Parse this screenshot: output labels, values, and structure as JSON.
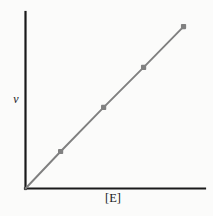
{
  "figure": {
    "background_color": "#fbfbfa",
    "axis_color": "#1a1a1a",
    "series_color": "#808080"
  },
  "labels": {
    "y_axis": "v",
    "x_axis": "[E]"
  },
  "chart_data": {
    "type": "line",
    "title": "",
    "subtitle": "",
    "xlabel": "[E]",
    "ylabel": "v",
    "grid": false,
    "legend": false,
    "legend_position": "none",
    "axis_ticks": false,
    "tick_labels": {
      "x": [],
      "y": []
    },
    "xlim": [
      0,
      1
    ],
    "ylim": [
      0,
      1
    ],
    "annotations": [],
    "series": [
      {
        "name": "v vs [E]",
        "color": "#808080",
        "marker": "square",
        "line_through_origin": true,
        "x": [
          0.0,
          0.195,
          0.434,
          0.656,
          0.878
        ],
        "y": [
          0.0,
          0.209,
          0.458,
          0.684,
          0.915
        ]
      }
    ]
  }
}
